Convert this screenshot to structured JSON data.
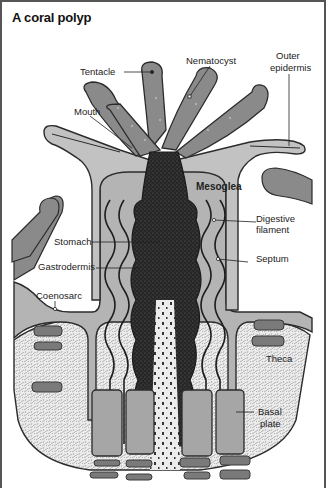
{
  "title": "A coral polyp",
  "labels": {
    "tentacle": "Tentacle",
    "nematocyst": "Nematocyst",
    "outer_epidermis_1": "Outer",
    "outer_epidermis_2": "epidermis",
    "mouth": "Mouth",
    "mesoglea": "Mesoglea",
    "digestive_filament_1": "Digestive",
    "digestive_filament_2": "filament",
    "stomach": "Stomach",
    "septum": "Septum",
    "gastrodermis": "Gastrodermis",
    "coenosarc": "Coenosarc",
    "theca": "Theca",
    "basal_plate_1": "Basal",
    "basal_plate_2": "plate"
  },
  "colors": {
    "tentacle_fill": "#8a8a8a",
    "tissue_fill": "#b4b4b4",
    "stomach_fill": "#2a2a2a",
    "skeleton_fill": "#e6e6e6",
    "outline": "#2b2b2b",
    "plate_fill": "#7a7a7a"
  }
}
